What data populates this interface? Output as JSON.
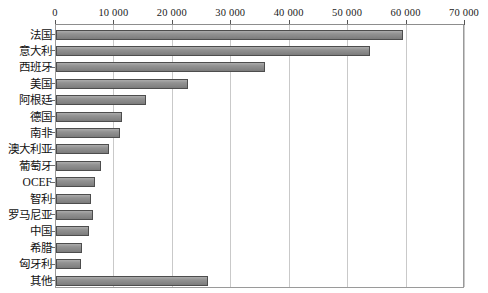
{
  "chart_data": {
    "type": "bar",
    "orientation": "horizontal",
    "title": "",
    "subtitle": "",
    "xlabel": "",
    "ylabel": "",
    "xlim": [
      0,
      70000
    ],
    "ylim": null,
    "grid": true,
    "legend": null,
    "legend_position": "none",
    "axis_position": "top",
    "tick_labels": [
      "0",
      "10 000",
      "20 000",
      "30 000",
      "40 000",
      "50 000",
      "60 000",
      "70 000"
    ],
    "tick_values": [
      0,
      10000,
      20000,
      30000,
      40000,
      50000,
      60000,
      70000
    ],
    "categories": [
      "法国",
      "意大利",
      "西班牙",
      "美国",
      "阿根廷",
      "德国",
      "南非",
      "澳大利亚",
      "葡萄牙",
      "OCEF",
      "智利",
      "罗马尼亚",
      "中国",
      "希腊",
      "匈牙利",
      "其他"
    ],
    "values": [
      59400,
      53800,
      35800,
      22600,
      15400,
      11300,
      11000,
      9100,
      7700,
      6700,
      6000,
      6300,
      5700,
      4500,
      4300,
      26000
    ],
    "series": [
      {
        "name": "",
        "values": [
          59400,
          53800,
          35800,
          22600,
          15400,
          11300,
          11000,
          9100,
          7700,
          6700,
          6000,
          6300,
          5700,
          4500,
          4300,
          26000
        ]
      }
    ],
    "colors": {
      "bar_fill": "#8c8c8c",
      "bar_border": "#4d4d4d",
      "grid": "#c9c9c9",
      "frame": "#9a9a9a",
      "text": "#121212",
      "background": "#ffffff"
    }
  }
}
